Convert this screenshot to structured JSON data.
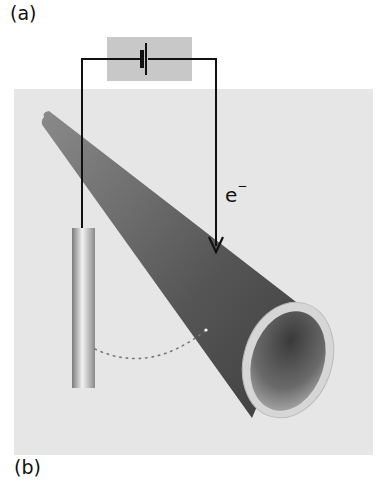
{
  "figure": {
    "panel_labels": [
      "(a)",
      "(b)"
    ],
    "electron_label": {
      "symbol": "e",
      "charge": "−"
    },
    "components": {
      "battery": "battery-symbol",
      "wire": "circuit-wire",
      "electrode": "cylindrical-electrode-rod",
      "tube": "hollow-conical-tube",
      "arc": "dotted-arc"
    },
    "colors": {
      "panel_background": "#e6e6e6",
      "battery_box": "#c8c8c8",
      "tube_dark": "#555555",
      "tube_rim": "#d8d8d8",
      "wire": "#111111",
      "dots": "#777777"
    }
  }
}
